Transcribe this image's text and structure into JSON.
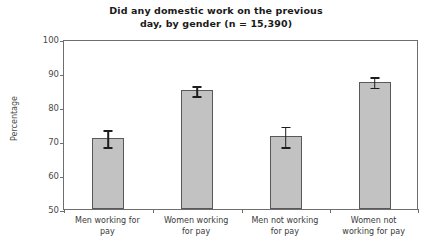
{
  "chart_data": {
    "type": "bar",
    "title": "Did any domestic work on the previous day, by gender (n = 15,390)",
    "title_lines": [
      "Did any domestic work on the previous",
      "day, by gender (n = 15,390)"
    ],
    "xlabel": "",
    "ylabel": "Percentage",
    "ylim": [
      50,
      100
    ],
    "yticks": [
      100,
      90,
      80,
      70,
      60,
      50
    ],
    "ytick_labels": [
      "100",
      "90",
      "80",
      "70",
      "60",
      "50"
    ],
    "grid": false,
    "legend": null,
    "categories": [
      "Men working for pay",
      "Women working for pay",
      "Men not working for pay",
      "Women not working for pay"
    ],
    "category_lines": [
      [
        "Men working for",
        "pay"
      ],
      [
        "Women working",
        "for pay"
      ],
      [
        "Men not working",
        "for pay"
      ],
      [
        "Women not",
        "working for pay"
      ]
    ],
    "values": [
      71.0,
      85.0,
      71.5,
      87.5
    ],
    "errors": [
      2.5,
      1.5,
      3.0,
      1.5
    ],
    "bar_color": "#c2c2c2",
    "bar_edge_color": "#585858",
    "error_color": "#1d1d1d",
    "axis_color": "#6e6e6e",
    "background": "#ffffff"
  }
}
